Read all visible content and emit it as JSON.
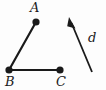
{
  "figure": {
    "type": "geometry-diagram",
    "width": 106,
    "height": 90,
    "background_color": "#fdfdfd",
    "stroke_color": "#1a1a1a",
    "labels": {
      "point_a": "A",
      "point_b": "B",
      "point_c": "C",
      "vector_d": "d"
    },
    "points": [
      {
        "name": "A",
        "x": 36,
        "y": 22,
        "dot_radius": 3.6
      },
      {
        "name": "B",
        "x": 9,
        "y": 70,
        "dot_radius": 3.6
      },
      {
        "name": "C",
        "x": 60,
        "y": 70,
        "dot_radius": 3.6
      }
    ],
    "segments": [
      {
        "name": "segment-BA",
        "from": "B",
        "to": "A",
        "x1": 9,
        "y1": 70,
        "x2": 36,
        "y2": 22,
        "width": 2.2
      },
      {
        "name": "segment-BC",
        "from": "B",
        "to": "C",
        "x1": 9,
        "y1": 70,
        "x2": 60,
        "y2": 70,
        "width": 2.2
      }
    ],
    "vector": {
      "name": "d",
      "tail_x": 92,
      "tail_y": 72,
      "head_x": 69,
      "head_y": 17,
      "width": 1.8,
      "arrowhead": "filled-triangle"
    }
  }
}
